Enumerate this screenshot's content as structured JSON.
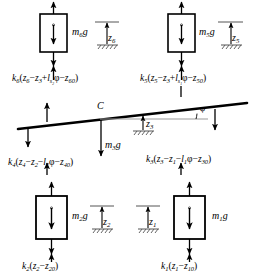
{
  "figure": {
    "type": "free-body-diagram",
    "stroke_color": "#000000",
    "background_color": "#ffffff",
    "ground_hatch_color": "#555555",
    "guide_line_color": "#999999"
  },
  "masses": {
    "m6": {
      "label_base": "m",
      "label_sub": "6",
      "label_suffix": "g"
    },
    "m5": {
      "label_base": "m",
      "label_sub": "5",
      "label_suffix": "g"
    },
    "m3": {
      "label_base": "m",
      "label_sub": "3",
      "label_suffix": "g"
    },
    "m2": {
      "label_base": "m",
      "label_sub": "2",
      "label_suffix": "g"
    },
    "m1": {
      "label_base": "m",
      "label_sub": "1",
      "label_suffix": "g"
    }
  },
  "coordinates": {
    "z6": {
      "base": "z",
      "sub": "6"
    },
    "z5": {
      "base": "z",
      "sub": "5"
    },
    "z3": {
      "base": "z",
      "sub": "3"
    },
    "z2": {
      "base": "z",
      "sub": "2"
    },
    "z1": {
      "base": "z",
      "sub": "1"
    }
  },
  "angle": {
    "symbol": "φ"
  },
  "point_c": {
    "label": "C"
  },
  "equations": {
    "k6": {
      "parts": [
        {
          "t": "k",
          "s": "6"
        },
        {
          "t": "(",
          "s": ""
        },
        {
          "t": "z",
          "s": "6"
        },
        {
          "t": "−",
          "s": ""
        },
        {
          "t": "z",
          "s": "3"
        },
        {
          "t": "+",
          "s": ""
        },
        {
          "t": "l",
          "s": "s2"
        },
        {
          "t": "φ−",
          "s": ""
        },
        {
          "t": "z",
          "s": "60"
        },
        {
          "t": ")",
          "s": ""
        }
      ],
      "plain": "k6(z6−z3+ls2φ−z60)"
    },
    "k5": {
      "parts": [
        {
          "t": "k",
          "s": "5"
        },
        {
          "t": "(",
          "s": ""
        },
        {
          "t": "z",
          "s": "5"
        },
        {
          "t": "−",
          "s": ""
        },
        {
          "t": "z",
          "s": "3"
        },
        {
          "t": "+",
          "s": ""
        },
        {
          "t": "l",
          "s": "s1"
        },
        {
          "t": "φ−",
          "s": ""
        },
        {
          "t": "z",
          "s": "50"
        },
        {
          "t": ")",
          "s": ""
        }
      ],
      "plain": "k5(z5−z3+ls1φ−z50)"
    },
    "k4": {
      "parts": [
        {
          "t": "k",
          "s": "4"
        },
        {
          "t": "(",
          "s": ""
        },
        {
          "t": "z",
          "s": "4"
        },
        {
          "t": "−",
          "s": ""
        },
        {
          "t": "z",
          "s": "2"
        },
        {
          "t": "−",
          "s": ""
        },
        {
          "t": "l",
          "s": "2"
        },
        {
          "t": "φ−",
          "s": ""
        },
        {
          "t": "z",
          "s": "40"
        },
        {
          "t": ")",
          "s": ""
        }
      ],
      "plain": "k4(z4−z2−l2φ−z40)"
    },
    "k3": {
      "parts": [
        {
          "t": "k",
          "s": "3"
        },
        {
          "t": "(",
          "s": ""
        },
        {
          "t": "z",
          "s": "3"
        },
        {
          "t": "−",
          "s": ""
        },
        {
          "t": "z",
          "s": "1"
        },
        {
          "t": "−",
          "s": ""
        },
        {
          "t": "l",
          "s": "1"
        },
        {
          "t": "φ−",
          "s": ""
        },
        {
          "t": "z",
          "s": "30"
        },
        {
          "t": ")",
          "s": ""
        }
      ],
      "plain": "k3(z3−z1−l1φ−z30)"
    },
    "k2": {
      "parts": [
        {
          "t": "k",
          "s": "2"
        },
        {
          "t": "(",
          "s": ""
        },
        {
          "t": "z",
          "s": "2"
        },
        {
          "t": "−",
          "s": ""
        },
        {
          "t": "z",
          "s": "20"
        },
        {
          "t": ")",
          "s": ""
        }
      ],
      "plain": "k2(z2−z20)"
    },
    "k1": {
      "parts": [
        {
          "t": "k",
          "s": "1"
        },
        {
          "t": "(",
          "s": ""
        },
        {
          "t": "z",
          "s": "1"
        },
        {
          "t": "−",
          "s": ""
        },
        {
          "t": "z",
          "s": "10"
        },
        {
          "t": ")",
          "s": ""
        }
      ],
      "plain": "k1(z1−z10)"
    }
  }
}
